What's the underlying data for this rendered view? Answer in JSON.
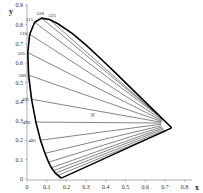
{
  "chart_data": {
    "type": "line",
    "title": "",
    "xlabel": "x",
    "ylabel": "y",
    "xlim": [
      0,
      0.85
    ],
    "ylim": [
      0,
      0.9
    ],
    "x_ticks": [
      "0",
      "0.1",
      "0.2",
      "0.3",
      "0.4",
      "0.5",
      "0.6",
      "0.7",
      "0.8"
    ],
    "y_ticks": [
      "0",
      "0.1",
      "0.2",
      "0.3",
      "0.4",
      "0.5",
      "0.6",
      "0.7",
      "0.8",
      "0.9"
    ],
    "grid": false,
    "spectral_locus": [
      [
        0.1741,
        0.005
      ],
      [
        0.144,
        0.0297
      ],
      [
        0.1241,
        0.0578
      ],
      [
        0.1096,
        0.0868
      ],
      [
        0.0913,
        0.1327
      ],
      [
        0.0687,
        0.2007
      ],
      [
        0.0454,
        0.295
      ],
      [
        0.0235,
        0.4127
      ],
      [
        0.0082,
        0.5384
      ],
      [
        0.0039,
        0.6548
      ],
      [
        0.0139,
        0.7502
      ],
      [
        0.0389,
        0.812
      ],
      [
        0.0743,
        0.8338
      ],
      [
        0.1142,
        0.8262
      ],
      [
        0.1547,
        0.8059
      ],
      [
        0.2296,
        0.7543
      ],
      [
        0.3016,
        0.6923
      ],
      [
        0.3731,
        0.6245
      ],
      [
        0.4441,
        0.5547
      ],
      [
        0.5125,
        0.4866
      ],
      [
        0.5752,
        0.4242
      ],
      [
        0.627,
        0.3725
      ],
      [
        0.6915,
        0.3083
      ],
      [
        0.7347,
        0.2653
      ]
    ],
    "purple_line": [
      [
        0.1741,
        0.005
      ],
      [
        0.7347,
        0.2653
      ]
    ],
    "wavelength_labels": [
      {
        "text": "515",
        "x": 0.039,
        "y": 0.812,
        "dx": -9,
        "dy": -1
      },
      {
        "text": "520",
        "x": 0.074,
        "y": 0.834,
        "dx": -5,
        "dy": -3
      },
      {
        "text": "525",
        "x": 0.114,
        "y": 0.826,
        "dx": -1,
        "dy": -3
      },
      {
        "text": "510",
        "x": 0.014,
        "y": 0.75,
        "dx": -10,
        "dy": 1
      },
      {
        "text": "505",
        "x": 0.004,
        "y": 0.655,
        "dx": -10,
        "dy": 2
      },
      {
        "text": "500",
        "x": 0.008,
        "y": 0.538,
        "dx": -10,
        "dy": 2
      },
      {
        "text": "495",
        "x": 0.024,
        "y": 0.413,
        "dx": -10,
        "dy": 2
      },
      {
        "text": "490",
        "x": 0.045,
        "y": 0.295,
        "dx": -13,
        "dy": 2
      },
      {
        "text": "485",
        "x": 0.069,
        "y": 0.201,
        "dx": -12,
        "dy": 2
      }
    ],
    "fan_lines": [
      {
        "from": [
          0.039,
          0.812
        ],
        "to": [
          0.69,
          0.31
        ]
      },
      {
        "from": [
          0.074,
          0.834
        ],
        "to": [
          0.692,
          0.308
        ]
      },
      {
        "from": [
          0.114,
          0.826
        ],
        "to": [
          0.695,
          0.305
        ]
      },
      {
        "from": [
          0.014,
          0.75
        ],
        "to": [
          0.688,
          0.306
        ]
      },
      {
        "from": [
          0.004,
          0.655
        ],
        "to": [
          0.686,
          0.302
        ]
      },
      {
        "from": [
          0.008,
          0.538
        ],
        "to": [
          0.684,
          0.298
        ]
      },
      {
        "from": [
          0.024,
          0.413
        ],
        "to": [
          0.682,
          0.294
        ]
      },
      {
        "from": [
          0.045,
          0.295
        ],
        "to": [
          0.68,
          0.29
        ]
      },
      {
        "from": [
          0.069,
          0.201
        ],
        "to": [
          0.68,
          0.284
        ]
      },
      {
        "from": [
          0.091,
          0.133
        ],
        "to": [
          0.682,
          0.276
        ]
      },
      {
        "from": [
          0.11,
          0.087
        ],
        "to": [
          0.686,
          0.27
        ]
      },
      {
        "from": [
          0.124,
          0.058
        ],
        "to": [
          0.69,
          0.264
        ]
      },
      {
        "from": [
          0.135,
          0.043
        ],
        "to": [
          0.694,
          0.258
        ]
      },
      {
        "from": [
          0.144,
          0.03
        ],
        "to": [
          0.7,
          0.252
        ]
      },
      {
        "from": [
          0.155,
          0.018
        ],
        "to": [
          0.706,
          0.248
        ]
      }
    ],
    "white_point": {
      "x": 0.333,
      "y": 0.333,
      "marker": "×"
    },
    "colors": {
      "locus": "#000000",
      "fan": "#333333",
      "axis": "#999999"
    }
  }
}
